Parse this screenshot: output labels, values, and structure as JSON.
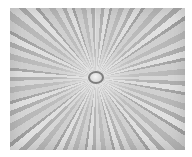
{
  "image": {
    "description": "Grayscale radial burst / zoom-blur pattern with a small ring at the center",
    "colors": {
      "light": "#e4e4e4",
      "mid": "#c8c8c8",
      "dark": "#9c9c9c",
      "ring": "#7e7e7e",
      "background": "#ffffff"
    }
  }
}
